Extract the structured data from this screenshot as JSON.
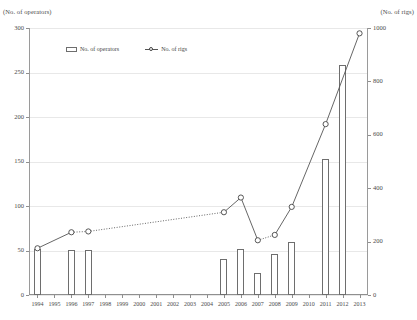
{
  "chart_data": {
    "type": "bar",
    "title": "",
    "subtitle": "",
    "xlabel": "",
    "ylabel": "(No. of operators)",
    "y2label": "(No. of rigs)",
    "grid": true,
    "legend_position": "top-left-inside",
    "categories": [
      "1994",
      "1995",
      "1996",
      "1997",
      "1998",
      "1999",
      "2000",
      "2001",
      "2002",
      "2003",
      "2004",
      "2005",
      "2006",
      "2007",
      "2008",
      "2009",
      "2010",
      "2011",
      "2012",
      "2013"
    ],
    "ylim": [
      0,
      300
    ],
    "yticks": [
      0,
      50,
      100,
      150,
      200,
      250,
      300
    ],
    "y2lim": [
      0,
      1000
    ],
    "y2ticks": [
      0,
      200,
      400,
      600,
      800,
      1000
    ],
    "series": [
      {
        "name": "No. of operators",
        "type": "bar",
        "axis": "left",
        "values": [
          52,
          null,
          51,
          51,
          null,
          null,
          null,
          null,
          null,
          null,
          null,
          40,
          52,
          25,
          46,
          60,
          null,
          153,
          258,
          null
        ]
      },
      {
        "name": "No. of rigs",
        "type": "line",
        "axis": "right",
        "marker": "circle",
        "linestyle": "dotted",
        "values": [
          175,
          null,
          235,
          238,
          null,
          null,
          null,
          null,
          null,
          null,
          null,
          310,
          365,
          205,
          225,
          330,
          null,
          640,
          null,
          980
        ]
      }
    ]
  },
  "legend": {
    "items": [
      {
        "label": "No. of operators",
        "marker": "bar-swatch"
      },
      {
        "label": "No. of rigs",
        "marker": "line-circle-swatch"
      }
    ]
  },
  "axes": {
    "left_caption": "(No. of operators)",
    "right_caption": "(No. of rigs)",
    "left_ticks": [
      "0",
      "50",
      "100",
      "150",
      "200",
      "250",
      "300"
    ],
    "right_ticks": [
      "0",
      "200",
      "400",
      "600",
      "800",
      "1000"
    ],
    "x_ticks": [
      "1994",
      "1995",
      "1996",
      "1997",
      "1998",
      "1999",
      "2000",
      "2001",
      "2002",
      "2003",
      "2004",
      "2005",
      "2006",
      "2007",
      "2008",
      "2009",
      "2010",
      "2011",
      "2012",
      "2013"
    ]
  },
  "colors": {
    "background": "#ffffff",
    "bar_outline": "#6e6e6e",
    "bar_fill": "#ffffff",
    "line": "#555555",
    "marker_outline": "#444444",
    "gridline": "#e8e8e8",
    "axis": "#8f8f8f",
    "text": "#3a3a3a"
  }
}
